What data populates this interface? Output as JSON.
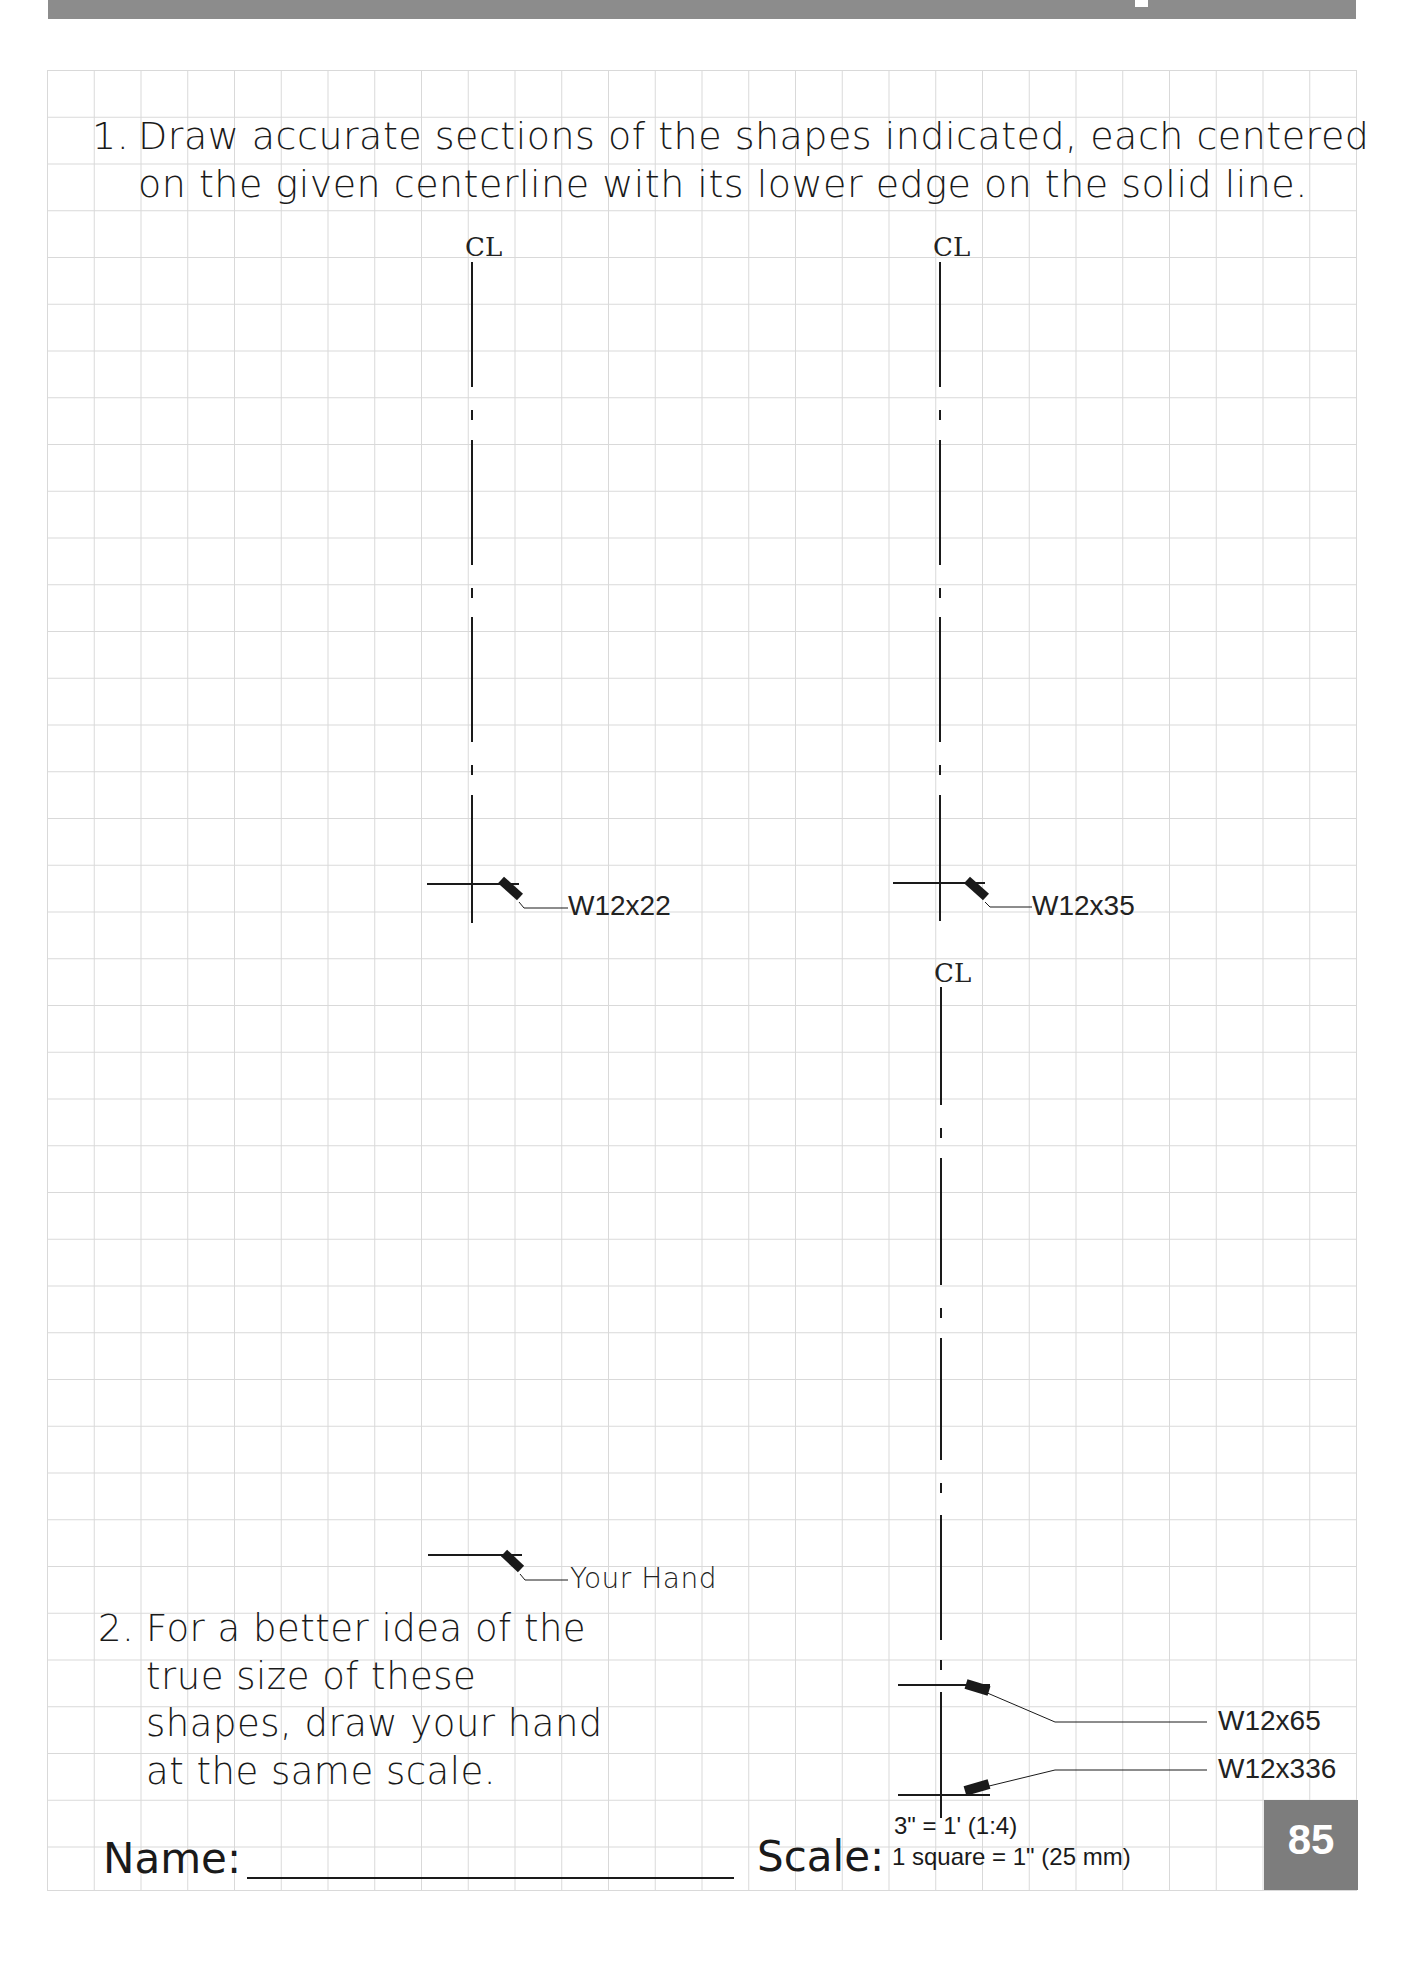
{
  "page": {
    "number": "85",
    "header_band_color": "#8c8c8c",
    "grid_color": "#d9d9d9"
  },
  "question1": {
    "number": "1.",
    "line1": "Draw accurate sections of the shapes indicated, each centered",
    "line2": "on the given centerline with its lower edge on the solid line."
  },
  "centerlines": [
    {
      "symbol": "CL",
      "label": "W12x22"
    },
    {
      "symbol": "CL",
      "label": "W12x35"
    },
    {
      "symbol": "CL",
      "labels": [
        "W12x65",
        "W12x336"
      ]
    }
  ],
  "hand": {
    "label": "Your Hand"
  },
  "question2": {
    "number": "2.",
    "lines": [
      "For a better idea of the",
      "true size of these",
      "shapes, draw your hand",
      "at the same scale."
    ]
  },
  "footer": {
    "name_label": "Name:",
    "scale_label": "Scale:",
    "scale_ratio": "3\" = 1' (1:4)",
    "scale_square": "1 square = 1\" (25 mm)"
  }
}
